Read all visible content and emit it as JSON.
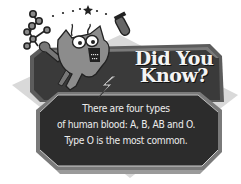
{
  "heading": {
    "line1": "Did You",
    "line2": "Know?"
  },
  "fact": {
    "lines": [
      "There are four types",
      "of human blood: A, B, AB and O.",
      "Type O is the most common."
    ]
  },
  "icons": {
    "character": "cartoon-creature-icon",
    "molecule": "molecule-icon",
    "test_tube": "test-tube-icon",
    "star": "star-icon",
    "lightning": "lightning-bolt-icon"
  },
  "colors": {
    "panel_dark": "#333333",
    "panel_mid": "#5a5a5a",
    "panel_edge": "#8a8a8a",
    "backdrop": "#d6d6d6",
    "text": "#eeeeee"
  }
}
